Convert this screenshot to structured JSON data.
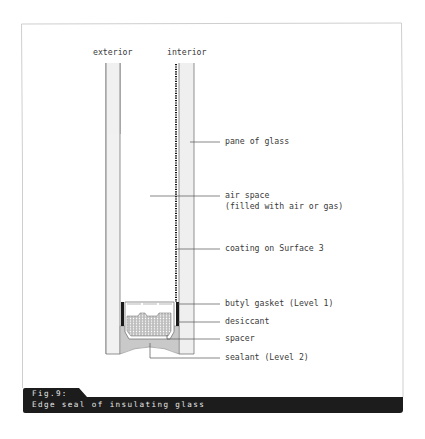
{
  "diagram": {
    "headers": {
      "exterior": "exterior",
      "interior": "interior"
    },
    "labels": [
      {
        "id": "pane",
        "text": "pane of glass"
      },
      {
        "id": "air_space_1",
        "text": "air space"
      },
      {
        "id": "air_space_2",
        "text": "(filled with air or gas)"
      },
      {
        "id": "coating",
        "text": "coating on Surface 3"
      },
      {
        "id": "butyl",
        "text": "butyl gasket (Level 1)"
      },
      {
        "id": "desiccant",
        "text": "desiccant"
      },
      {
        "id": "spacer",
        "text": "spacer"
      },
      {
        "id": "sealant",
        "text": "sealant (Level 2)"
      }
    ]
  },
  "caption": {
    "fig": "Fig.9:",
    "title": "Edge seal of insulating glass"
  },
  "colors": {
    "glass_fill": "#efefef",
    "sealant_fill": "#c9c9c9",
    "caption_bg": "#1c1c1c",
    "border": "#cfcfcf"
  }
}
